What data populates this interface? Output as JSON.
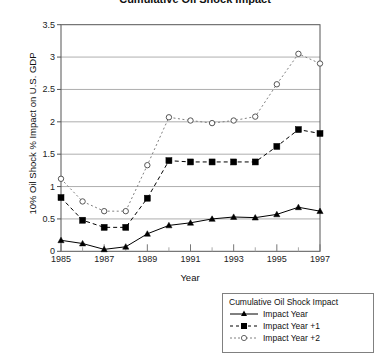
{
  "chart_data": {
    "type": "line",
    "title": "Cumulative Oil Shock Impact",
    "xlabel": "Year",
    "ylabel": "10% Oil Shock % Impact on U.S. GDP",
    "x": [
      1985,
      1986,
      1987,
      1988,
      1989,
      1990,
      1991,
      1992,
      1993,
      1994,
      1995,
      1996,
      1997
    ],
    "xlim": [
      1985,
      1997
    ],
    "ylim": [
      0,
      3.5
    ],
    "ytick_labels": [
      "0",
      "0.5",
      "1",
      "1.5",
      "2",
      "2.5",
      "3",
      "3.5"
    ],
    "ytick_values": [
      0,
      0.5,
      1,
      1.5,
      2,
      2.5,
      3,
      3.5
    ],
    "xtick_labels": [
      "1985",
      "1987",
      "1989",
      "1991",
      "1993",
      "1995",
      "1997"
    ],
    "xtick_values": [
      1985,
      1987,
      1989,
      1991,
      1993,
      1995,
      1997
    ],
    "grid": "horizontal",
    "legend_position": "bottom-right",
    "legend_title": "Cumulative Oil Shock Impact",
    "series": [
      {
        "name": "Impact Year",
        "marker": "triangle",
        "line_style": "solid",
        "color": "#000000",
        "values": [
          0.17,
          0.12,
          0.03,
          0.07,
          0.27,
          0.4,
          0.44,
          0.5,
          0.53,
          0.52,
          0.57,
          0.68,
          0.62
        ]
      },
      {
        "name": "Impact Year +1",
        "marker": "square",
        "line_style": "dashed",
        "color": "#000000",
        "values": [
          0.83,
          0.48,
          0.37,
          0.37,
          0.82,
          1.4,
          1.38,
          1.38,
          1.38,
          1.38,
          1.62,
          1.88,
          1.82
        ]
      },
      {
        "name": "Impact Year +2",
        "marker": "circle-open",
        "line_style": "dotted",
        "color": "#808080",
        "values": [
          1.12,
          0.77,
          0.62,
          0.62,
          1.33,
          2.07,
          2.02,
          1.98,
          2.02,
          2.08,
          2.58,
          3.05,
          2.9
        ]
      }
    ]
  },
  "legend": {
    "title": "Cumulative Oil Shock Impact",
    "items": [
      {
        "label": "Impact Year"
      },
      {
        "label": "Impact Year +1"
      },
      {
        "label": "Impact Year +2"
      }
    ]
  },
  "axes": {
    "y_title": "10% Oil Shock % Impact on U.S. GDP",
    "x_title": "Year"
  },
  "colors": {
    "axis": "#555555",
    "grid": "#999999",
    "series_dark": "#000000",
    "series_gray": "#808080",
    "background": "#ffffff"
  }
}
